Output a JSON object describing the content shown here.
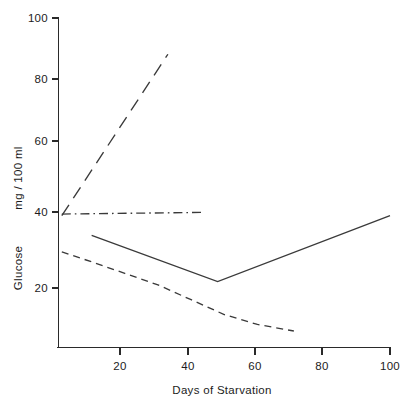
{
  "chart_data": {
    "type": "line",
    "title": "",
    "xlabel": "Days of Starvation",
    "ylabel_units": "mg / 100 ml",
    "ylabel_quantity": "Glucose",
    "xlim": [
      0,
      100
    ],
    "ylim": [
      0,
      100
    ],
    "xticks": [
      20,
      40,
      60,
      80,
      100
    ],
    "xtick_labels": [
      "20",
      "40",
      "60",
      "80",
      "100"
    ],
    "yticks": [
      20,
      40,
      60,
      80,
      100
    ],
    "ytick_labels": [
      "20",
      "40",
      "60",
      "80",
      "100"
    ],
    "grid": false,
    "legend": "none",
    "series": [
      {
        "name": "rising-long-dash",
        "style": "long-dash",
        "x": [
          1,
          33
        ],
        "values": [
          40,
          89
        ]
      },
      {
        "name": "flat-dash-dot",
        "style": "dash-dot",
        "x": [
          1,
          43
        ],
        "values": [
          40.5,
          41
        ]
      },
      {
        "name": "v-shaped-solid",
        "style": "solid",
        "x": [
          10,
          48,
          100
        ],
        "values": [
          34,
          20,
          40
        ]
      },
      {
        "name": "declining-short-dash",
        "style": "short-dash",
        "x": [
          1,
          10,
          20,
          30,
          40,
          50,
          60,
          71
        ],
        "values": [
          29,
          26,
          22.5,
          19,
          14.5,
          10,
          7,
          5
        ]
      }
    ]
  },
  "axes": {
    "x_axis_label": "Days of Starvation",
    "y_axis_label_top": "mg / 100 ml",
    "y_axis_label_bottom": "Glucose"
  }
}
